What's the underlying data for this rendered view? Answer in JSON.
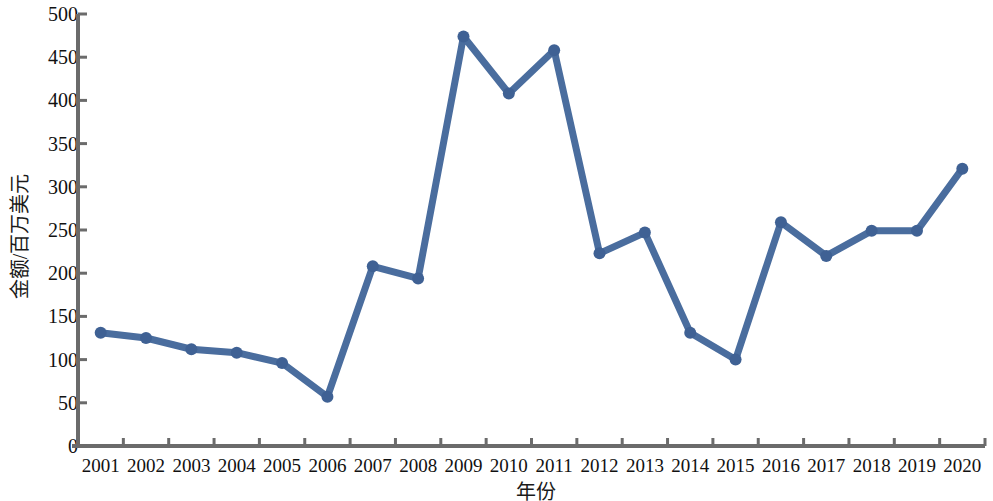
{
  "chart_data": {
    "type": "line",
    "title": "",
    "xlabel": "年份",
    "ylabel": "金额/百万美元",
    "categories": [
      "2001",
      "2002",
      "2003",
      "2004",
      "2005",
      "2006",
      "2007",
      "2008",
      "2009",
      "2010",
      "2011",
      "2012",
      "2013",
      "2014",
      "2015",
      "2016",
      "2017",
      "2018",
      "2019",
      "2020"
    ],
    "values": [
      131,
      125,
      112,
      108,
      96,
      57,
      208,
      194,
      474,
      408,
      458,
      223,
      247,
      131,
      100,
      259,
      220,
      249,
      249,
      321
    ],
    "series": [
      {
        "name": "金额",
        "values": [
          131,
          125,
          112,
          108,
          96,
          57,
          208,
          194,
          474,
          408,
          458,
          223,
          247,
          131,
          100,
          259,
          220,
          249,
          249,
          321
        ]
      }
    ],
    "ylim": [
      0,
      500
    ],
    "ytick_values": [
      0,
      50,
      100,
      150,
      200,
      250,
      300,
      350,
      400,
      450,
      500
    ],
    "ytick_labels": [
      "0",
      "50",
      "100",
      "150",
      "200",
      "250",
      "300",
      "350",
      "400",
      "450",
      "500"
    ],
    "grid": false,
    "legend": "none",
    "marker": "circle",
    "line_color": "#4a6d9e",
    "marker_color": "#3f6194",
    "axis_color": "#6b6b6b"
  }
}
